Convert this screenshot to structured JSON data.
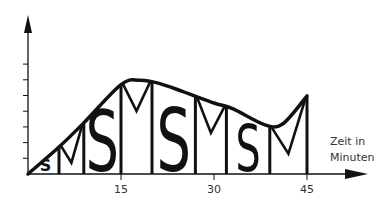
{
  "chart_data": {
    "type": "line",
    "title": "",
    "xlabel": "Zeit in Minuten",
    "xlabel_lines": [
      "Zeit in",
      "Minuten"
    ],
    "ylabel": "",
    "x_ticks": [
      15,
      30,
      45
    ],
    "x_tick_labels": [
      "15",
      "30",
      "45"
    ],
    "xlim": [
      0,
      45
    ],
    "y_tick_count": 7,
    "y_tick_labels": [],
    "grid": false,
    "legend": null,
    "series": [
      {
        "name": "Leistungskurve",
        "x": [
          0,
          5,
          9,
          15,
          18,
          21,
          25,
          30,
          33,
          38,
          41,
          45
        ],
        "y": [
          0,
          1.9,
          3.6,
          6.3,
          6.6,
          6.4,
          5.8,
          5.0,
          4.6,
          3.5,
          3.5,
          5.5
        ]
      }
    ],
    "segments": [
      {
        "label": "S",
        "x_start": 0,
        "x_end": 5
      },
      {
        "label": "M",
        "x_start": 5,
        "x_end": 9
      },
      {
        "label": "S",
        "x_start": 9,
        "x_end": 15
      },
      {
        "label": "M",
        "x_start": 15,
        "x_end": 20
      },
      {
        "label": "S",
        "x_start": 20,
        "x_end": 27
      },
      {
        "label": "M",
        "x_start": 27,
        "x_end": 32
      },
      {
        "label": "S",
        "x_start": 32,
        "x_end": 39
      },
      {
        "label": "M",
        "x_start": 39,
        "x_end": 45
      }
    ],
    "annotations": [
      "S",
      "M",
      "S",
      "M",
      "S",
      "M",
      "S",
      "M"
    ]
  },
  "colors": {
    "line": "#111111",
    "text": "#333333",
    "background": "#ffffff"
  }
}
